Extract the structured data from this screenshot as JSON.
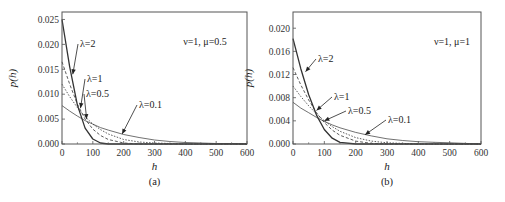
{
  "chart_data": [
    {
      "type": "line",
      "panel": "(a)",
      "title": "",
      "xlabel": "h",
      "ylabel": "p(h)",
      "xlim": [
        0,
        600
      ],
      "ylim": [
        0,
        0.0265
      ],
      "xticks": [
        0,
        100,
        200,
        300,
        400,
        500,
        600
      ],
      "xtick_labels": [
        "0",
        "100",
        "200",
        "300",
        "400",
        "500",
        "600"
      ],
      "yticks": [
        0.0,
        0.005,
        0.01,
        0.015,
        0.02,
        0.025
      ],
      "ytick_labels": [
        "0.000",
        "0.005",
        "0.010",
        "0.015",
        "0.020",
        "0.025"
      ],
      "grid": false,
      "legend": "none (inline arrow annotations)",
      "parameter_text": "ν=1, μ=0.5",
      "x": [
        0,
        25,
        50,
        75,
        100,
        125,
        150,
        200,
        250,
        300,
        350,
        400,
        450,
        500,
        550,
        600
      ],
      "series": [
        {
          "name": "λ=2",
          "style": "solid-bold",
          "values": [
            0.025,
            0.0155,
            0.0078,
            0.0032,
            0.001,
            0.0002,
            0.0,
            0.0,
            0.0,
            0.0,
            0.0,
            0.0,
            0.0,
            0.0,
            0.0,
            0.0
          ]
        },
        {
          "name": "λ=1",
          "style": "dashed",
          "values": [
            0.0165,
            0.012,
            0.008,
            0.005,
            0.003,
            0.0017,
            0.0009,
            0.0002,
            0.0,
            0.0,
            0.0,
            0.0,
            0.0,
            0.0,
            0.0,
            0.0
          ]
        },
        {
          "name": "λ=0.5",
          "style": "dotted",
          "values": [
            0.012,
            0.0095,
            0.0073,
            0.0055,
            0.004,
            0.0029,
            0.002,
            0.0009,
            0.0004,
            0.0002,
            0.0001,
            0.0,
            0.0,
            0.0,
            0.0,
            0.0
          ]
        },
        {
          "name": "λ=0.1",
          "style": "solid-thin",
          "values": [
            0.0077,
            0.0066,
            0.0056,
            0.0047,
            0.004,
            0.0033,
            0.0028,
            0.0019,
            0.0013,
            0.0008,
            0.0005,
            0.0003,
            0.0002,
            0.0001,
            0.0001,
            0.0
          ]
        }
      ],
      "annotations": [
        {
          "text": "λ=2",
          "arrow_to": [
            35,
            0.014
          ]
        },
        {
          "text": "λ=1",
          "arrow_to": [
            60,
            0.0072
          ]
        },
        {
          "text": "λ=0.5",
          "arrow_to": [
            80,
            0.005
          ]
        },
        {
          "text": "λ=0.1",
          "arrow_to": [
            195,
            0.002
          ]
        }
      ]
    },
    {
      "type": "line",
      "panel": "(b)",
      "title": "",
      "xlabel": "h",
      "ylabel": "p(h)",
      "xlim": [
        0,
        600
      ],
      "ylim": [
        0,
        0.0228
      ],
      "xticks": [
        0,
        100,
        200,
        300,
        400,
        500,
        600
      ],
      "xtick_labels": [
        "0",
        "100",
        "200",
        "300",
        "400",
        "500",
        "600"
      ],
      "yticks": [
        0.0,
        0.004,
        0.008,
        0.012,
        0.016,
        0.02
      ],
      "ytick_labels": [
        "0.000",
        "0.004",
        "0.008",
        "0.012",
        "0.016",
        "0.020"
      ],
      "grid": false,
      "legend": "none (inline arrow annotations)",
      "parameter_text": "ν=1, μ=1",
      "x": [
        0,
        25,
        50,
        75,
        100,
        125,
        150,
        200,
        250,
        300,
        350,
        400,
        450,
        500,
        550,
        600
      ],
      "series": [
        {
          "name": "λ=2",
          "style": "solid-bold",
          "values": [
            0.0182,
            0.013,
            0.0085,
            0.005,
            0.0025,
            0.001,
            0.0003,
            0.0,
            0.0,
            0.0,
            0.0,
            0.0,
            0.0,
            0.0,
            0.0,
            0.0
          ]
        },
        {
          "name": "λ=1",
          "style": "dashed",
          "values": [
            0.0132,
            0.0102,
            0.0076,
            0.0054,
            0.0037,
            0.0024,
            0.0015,
            0.0005,
            0.0001,
            0.0,
            0.0,
            0.0,
            0.0,
            0.0,
            0.0,
            0.0
          ]
        },
        {
          "name": "λ=0.5",
          "style": "dotted",
          "values": [
            0.01,
            0.0082,
            0.0066,
            0.0052,
            0.004,
            0.003,
            0.0022,
            0.0011,
            0.0005,
            0.0002,
            0.0001,
            0.0,
            0.0,
            0.0,
            0.0,
            0.0
          ]
        },
        {
          "name": "λ=0.1",
          "style": "solid-thin",
          "values": [
            0.0072,
            0.0062,
            0.0054,
            0.0046,
            0.0039,
            0.0033,
            0.0028,
            0.002,
            0.0014,
            0.0009,
            0.0006,
            0.0004,
            0.0003,
            0.0002,
            0.0001,
            0.0
          ]
        }
      ],
      "annotations": [
        {
          "text": "λ=2",
          "arrow_to": [
            40,
            0.0125
          ]
        },
        {
          "text": "λ=1",
          "arrow_to": [
            75,
            0.0058
          ]
        },
        {
          "text": "λ=0.5",
          "arrow_to": [
            100,
            0.004
          ]
        },
        {
          "text": "λ=0.1",
          "arrow_to": [
            230,
            0.0016
          ]
        }
      ]
    }
  ],
  "panels": [
    {
      "label": "(a)",
      "xlabel": "h",
      "ylabel": "p(h)",
      "param": "ν=1, μ=0.5"
    },
    {
      "label": "(b)",
      "xlabel": "h",
      "ylabel": "p(h)",
      "param": "ν=1, μ=1"
    }
  ],
  "layout": [
    {
      "left": 62,
      "right": 247,
      "top": 12,
      "bottom": 144,
      "param_x": 205,
      "param_y": 45,
      "annot_pos": [
        [
          80,
          47
        ],
        [
          87,
          82
        ],
        [
          86,
          97
        ],
        [
          139,
          108
        ]
      ]
    },
    {
      "left": 293,
      "right": 481,
      "top": 12,
      "bottom": 144,
      "param_x": 452,
      "param_y": 45,
      "annot_pos": [
        [
          318,
          62
        ],
        [
          334,
          100
        ],
        [
          348,
          114
        ],
        [
          388,
          123
        ]
      ]
    }
  ],
  "colors": {
    "axis": "#555555",
    "curve": "#333333",
    "text": "#222222",
    "background": "#ffffff"
  }
}
